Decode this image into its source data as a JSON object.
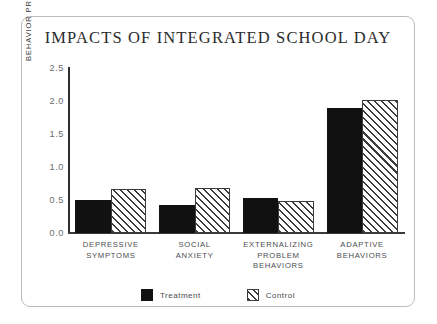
{
  "chart_data": {
    "type": "bar",
    "title": "IMPACTS OF INTEGRATED SCHOOL DAY",
    "xlabel": "",
    "ylabel": "BEHAVIOR PROBLEM SCORE",
    "ylim": [
      0.0,
      2.5
    ],
    "yticks": [
      "2.5",
      "2.0",
      "1.5",
      "1.0",
      "0.5",
      "0.0"
    ],
    "ytick_values": [
      2.5,
      2.0,
      1.5,
      1.0,
      0.5,
      0.0
    ],
    "grid": false,
    "legend_position": "bottom",
    "categories": [
      "DEPRESSIVE\nSYMPTOMS",
      "SOCIAL\nANXIETY",
      "EXTERNALIZING\nPROBLEM\nBEHAVIORS",
      "ADAPTIVE\nBEHAVIORS"
    ],
    "category_lines": [
      [
        "DEPRESSIVE",
        "SYMPTOMS"
      ],
      [
        "SOCIAL",
        "ANXIETY"
      ],
      [
        "EXTERNALIZING",
        "PROBLEM",
        "BEHAVIORS"
      ],
      [
        "ADAPTIVE",
        "BEHAVIORS"
      ]
    ],
    "series": [
      {
        "name": "Treatment",
        "values": [
          0.5,
          0.43,
          0.53,
          1.9
        ],
        "color": "#111111",
        "fill": "solid"
      },
      {
        "name": "Control",
        "values": [
          0.66,
          0.68,
          0.48,
          2.02
        ],
        "color": "#3c3c3c",
        "fill": "diagonal-hatch"
      }
    ]
  },
  "legend": {
    "entries": [
      {
        "label": "Treatment",
        "swatch": "solid-black-square"
      },
      {
        "label": "Control",
        "swatch": "hatched-square"
      }
    ]
  },
  "colors": {
    "frame_border": "#b9bcbe",
    "axis": "#2f2f2f",
    "tick_text": "#6a6d70",
    "label_text": "#4a4d50",
    "title_text": "#2b2b2b",
    "background": "#ffffff"
  }
}
